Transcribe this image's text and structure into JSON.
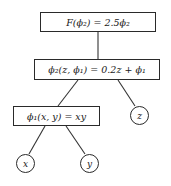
{
  "diagram": {
    "type": "computational-graph-tree",
    "nodes": {
      "F": {
        "label": "F(ϕ₂) = 2.5ϕ₂",
        "shape": "box"
      },
      "phi2": {
        "label": "ϕ₂(z, ϕ₁) = 0.2z + ϕ₁",
        "shape": "box"
      },
      "phi1": {
        "label": "ϕ₁(x, y) = xy",
        "shape": "box"
      },
      "z": {
        "label": "z",
        "shape": "circle"
      },
      "x": {
        "label": "x",
        "shape": "circle"
      },
      "y": {
        "label": "y",
        "shape": "circle"
      }
    },
    "edges": [
      {
        "from": "F",
        "to": "phi2"
      },
      {
        "from": "phi2",
        "to": "phi1"
      },
      {
        "from": "phi2",
        "to": "z"
      },
      {
        "from": "phi1",
        "to": "x"
      },
      {
        "from": "phi1",
        "to": "y"
      }
    ],
    "colors": {
      "stroke": "#2a2a2a",
      "background": "#ffffff",
      "text": "#1a1a1a"
    }
  }
}
